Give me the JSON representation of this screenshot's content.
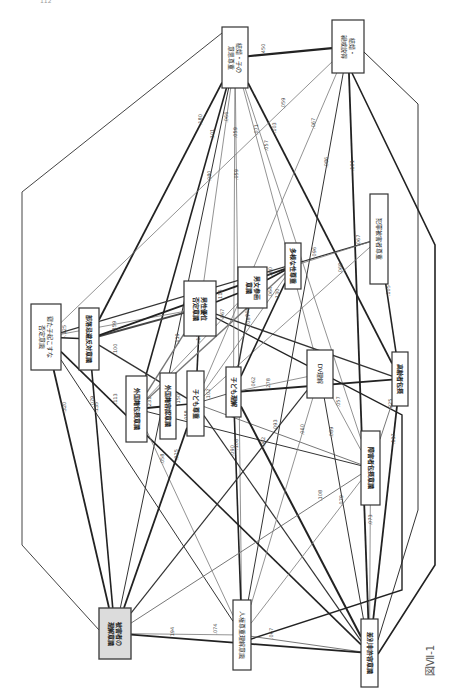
{
  "page_number": "112",
  "figure_label": "図Ⅶ-1",
  "nodes": [
    {
      "id": "kekkon_ko",
      "lines": [
        "結婚・子の",
        "意思尊重"
      ],
      "x": 222,
      "y": 27,
      "w": 26,
      "h": 61,
      "bold": false,
      "shaded": false
    },
    {
      "id": "kekkon_ikou",
      "lines": [
        "結婚・",
        "親戚説得"
      ],
      "x": 332,
      "y": 20,
      "w": 32,
      "h": 53,
      "bold": false,
      "shaded": false
    },
    {
      "id": "neta_ko",
      "lines": [
        "寝た子起こすな",
        "否定意識"
      ],
      "x": 31,
      "y": 304,
      "w": 30,
      "h": 66,
      "bold": false,
      "shaded": false
    },
    {
      "id": "buraku_ishiki",
      "lines": [
        "部落忌避反対意識"
      ],
      "x": 79,
      "y": 308,
      "w": 20,
      "h": 62,
      "bold": true,
      "shaded": false
    },
    {
      "id": "dansei_yui",
      "lines": [
        "男性優位",
        "否定意識"
      ],
      "x": 184,
      "y": 281,
      "w": 32,
      "h": 55,
      "bold": true,
      "shaded": false
    },
    {
      "id": "danjo_sanka",
      "lines": [
        "男女参画",
        "意識"
      ],
      "x": 238,
      "y": 267,
      "w": 29,
      "h": 41,
      "bold": true,
      "shaded": false
    },
    {
      "id": "tayousei",
      "lines": [
        "多様な性尊重"
      ],
      "x": 285,
      "y": 243,
      "w": 16,
      "h": 46,
      "bold": true,
      "shaded": false
    },
    {
      "id": "hanzai",
      "lines": [
        "犯罪被害者尊重"
      ],
      "x": 370,
      "y": 194,
      "w": 18,
      "h": 90,
      "bold": false,
      "shaded": false
    },
    {
      "id": "gaikoku_housetsu",
      "lines": [
        "外国籍包摂意識"
      ],
      "x": 126,
      "y": 376,
      "w": 21,
      "h": 66,
      "bold": true,
      "shaded": false
    },
    {
      "id": "gaikoku_youninn",
      "lines": [
        "外国籍容認意識"
      ],
      "x": 160,
      "y": 373,
      "w": 16,
      "h": 66,
      "bold": true,
      "shaded": false
    },
    {
      "id": "kodomo_sonchou",
      "lines": [
        "子ども尊重"
      ],
      "x": 187,
      "y": 371,
      "w": 17,
      "h": 65,
      "bold": true,
      "shaded": false
    },
    {
      "id": "kodomo_rikai",
      "lines": [
        "子ども理解"
      ],
      "x": 226,
      "y": 367,
      "w": 15,
      "h": 50,
      "bold": true,
      "shaded": false
    },
    {
      "id": "dv_rikai",
      "lines": [
        "DV理解"
      ],
      "x": 307,
      "y": 350,
      "w": 26,
      "h": 48,
      "bold": false,
      "shaded": false
    },
    {
      "id": "koureisha",
      "lines": [
        "高齢者包摂"
      ],
      "x": 392,
      "y": 352,
      "w": 16,
      "h": 54,
      "bold": true,
      "shaded": false
    },
    {
      "id": "shougaisha",
      "lines": [
        "障害者包摂意識"
      ],
      "x": 361,
      "y": 431,
      "w": 19,
      "h": 74,
      "bold": true,
      "shaded": false
    },
    {
      "id": "jinken",
      "lines": [
        "人権尊重理解意識"
      ],
      "x": 233,
      "y": 600,
      "w": 18,
      "h": 70,
      "bold": false,
      "shaded": false
    },
    {
      "id": "higaisha",
      "lines": [
        "被害者の",
        "理解意識"
      ],
      "x": 99,
      "y": 608,
      "w": 32,
      "h": 51,
      "bold": true,
      "shaded": true
    },
    {
      "id": "sabetsu_hinin",
      "lines": [
        "差別非許容意識"
      ],
      "x": 361,
      "y": 619,
      "w": 17,
      "h": 68,
      "bold": true,
      "shaded": false
    }
  ],
  "edges": [
    {
      "from": "kekkon_ko",
      "to": "higaisha",
      "label": ".080",
      "weight": 1.0,
      "color": "#333"
    },
    {
      "from": "kekkon_ko",
      "to": "buraku_ishiki",
      "label": ".180",
      "weight": 1.8,
      "color": "#222"
    },
    {
      "from": "kekkon_ko",
      "to": "gaikoku_housetsu",
      "label": ".101",
      "weight": 1.6,
      "color": "#222"
    },
    {
      "from": "kekkon_ko",
      "to": "dansei_yui",
      "label": ".066",
      "weight": 0.8,
      "color": "#777"
    },
    {
      "from": "kekkon_ko",
      "to": "kekkon_ikou",
      "label": ".450",
      "weight": 2.2,
      "color": "#222"
    },
    {
      "from": "kekkon_ko",
      "to": "koureisha",
      "label": ".103",
      "weight": 1.8,
      "color": "#222"
    },
    {
      "from": "kekkon_ko",
      "to": "shougaisha",
      "label": ".057",
      "weight": 0.8,
      "color": "#777"
    },
    {
      "from": "kekkon_ko",
      "to": "dv_rikai",
      "label": ".071",
      "weight": 0.8,
      "color": "#777"
    },
    {
      "from": "kekkon_ko",
      "to": "kodomo_rikai",
      "label": ".059",
      "weight": 0.8,
      "color": "#777"
    },
    {
      "from": "kekkon_ko",
      "to": "jinken",
      "label": ".059",
      "weight": 0.8,
      "color": "#777"
    },
    {
      "from": "kekkon_ikou",
      "to": "neta_ko",
      "label": ".059",
      "weight": 0.8,
      "color": "#777"
    },
    {
      "from": "kekkon_ikou",
      "to": "kodomo_sonchou",
      "label": ".067",
      "weight": 0.8,
      "color": "#777"
    },
    {
      "from": "kekkon_ikou",
      "to": "sabetsu_hinin",
      "label": ".101",
      "weight": 1.8,
      "color": "#222"
    },
    {
      "from": "kekkon_ikou",
      "to": "jinken",
      "label": ".086",
      "weight": 1.0,
      "color": "#333"
    },
    {
      "from": "hanzai",
      "to": "neta_ko",
      "label": ".096",
      "weight": 1.2,
      "color": "#333"
    },
    {
      "from": "hanzai",
      "to": "tayousei",
      "label": ".067",
      "weight": 0.8,
      "color": "#777"
    },
    {
      "from": "hanzai",
      "to": "kodomo_sonchou",
      "label": ".068",
      "weight": 0.8,
      "color": "#777"
    },
    {
      "from": "hanzai",
      "to": "koureisha",
      "label": ".105",
      "weight": 1.6,
      "color": "#222"
    },
    {
      "from": "neta_ko",
      "to": "buraku_ishiki",
      "label": "-.125",
      "weight": 1.6,
      "color": "#222"
    },
    {
      "from": "neta_ko",
      "to": "higaisha",
      "label": ".320",
      "weight": 1.8,
      "color": "#222"
    },
    {
      "from": "neta_ko",
      "to": "sabetsu_hinin",
      "label": ".113",
      "weight": 1.6,
      "color": "#222"
    },
    {
      "from": "neta_ko",
      "to": "jinken",
      "label": ".079",
      "weight": 1.0,
      "color": "#333"
    },
    {
      "from": "neta_ko",
      "to": "dansei_yui",
      "label": ".071",
      "weight": 0.8,
      "color": "#777"
    },
    {
      "from": "buraku_ishiki",
      "to": "higaisha",
      "label": ".135",
      "weight": 1.6,
      "color": "#222"
    },
    {
      "from": "buraku_ishiki",
      "to": "dansei_yui",
      "label": ".159",
      "weight": 2.0,
      "color": "#444"
    },
    {
      "from": "buraku_ishiki",
      "to": "kodomo_sonchou",
      "label": ".100",
      "weight": 1.4,
      "color": "#333"
    },
    {
      "from": "dansei_yui",
      "to": "danjo_sanka",
      "label": ".115",
      "weight": 1.6,
      "color": "#222"
    },
    {
      "from": "dansei_yui",
      "to": "gaikoku_housetsu",
      "label": ".119",
      "weight": 1.4,
      "color": "#777"
    },
    {
      "from": "dansei_yui",
      "to": "kodomo_sonchou",
      "label": ".132",
      "weight": 1.6,
      "color": "#222"
    },
    {
      "from": "dansei_yui",
      "to": "koureisha",
      "label": ".087",
      "weight": 1.4,
      "color": "#333"
    },
    {
      "from": "danjo_sanka",
      "to": "tayousei",
      "label": ".180",
      "weight": 1.8,
      "color": "#222"
    },
    {
      "from": "danjo_sanka",
      "to": "gaikoku_housetsu",
      "label": ".067",
      "weight": 0.8,
      "color": "#777"
    },
    {
      "from": "danjo_sanka",
      "to": "kodomo_rikai",
      "label": ".068",
      "weight": 1.4,
      "color": "#333"
    },
    {
      "from": "tayousei",
      "to": "buraku_ishiki",
      "label": ".172",
      "weight": 1.8,
      "color": "#222"
    },
    {
      "from": "tayousei",
      "to": "gaikoku_housetsu",
      "label": ".112",
      "weight": 1.4,
      "color": "#777"
    },
    {
      "from": "tayousei",
      "to": "kodomo_rikai",
      "label": ".130",
      "weight": 1.6,
      "color": "#222"
    },
    {
      "from": "tayousei",
      "to": "kodomo_sonchou",
      "label": ".064",
      "weight": 0.8,
      "color": "#777"
    },
    {
      "from": "gaikoku_housetsu",
      "to": "gaikoku_youninn",
      "label": ".231",
      "weight": 1.8,
      "color": "#222"
    },
    {
      "from": "gaikoku_housetsu",
      "to": "shougaisha",
      "label": ".058",
      "weight": 1.0,
      "color": "#333"
    },
    {
      "from": "gaikoku_housetsu",
      "to": "jinken",
      "label": ".058",
      "weight": 0.8,
      "color": "#777"
    },
    {
      "from": "gaikoku_youninn",
      "to": "kodomo_sonchou",
      "label": ".150",
      "weight": 1.6,
      "color": "#222"
    },
    {
      "from": "kodomo_sonchou",
      "to": "kodomo_rikai",
      "label": ".102",
      "weight": 1.0,
      "color": "#555"
    },
    {
      "from": "kodomo_sonchou",
      "to": "higaisha",
      "label": ".325",
      "weight": 1.8,
      "color": "#222"
    },
    {
      "from": "kodomo_sonchou",
      "to": "sabetsu_hinin",
      "label": ".090",
      "weight": 1.2,
      "color": "#333"
    },
    {
      "from": "kodomo_sonchou",
      "to": "shougaisha",
      "label": ".058",
      "weight": 1.0,
      "color": "#777"
    },
    {
      "from": "kodomo_rikai",
      "to": "koureisha",
      "label": ".278",
      "weight": 2.0,
      "color": "#222"
    },
    {
      "from": "kodomo_rikai",
      "to": "sabetsu_hinin",
      "label": ".062",
      "weight": 2.0,
      "color": "#222"
    },
    {
      "from": "kodomo_rikai",
      "to": "dv_rikai",
      "label": ".062",
      "weight": 0.8,
      "color": "#777"
    },
    {
      "from": "kodomo_rikai",
      "to": "jinken",
      "label": ".108",
      "weight": 1.6,
      "color": "#222"
    },
    {
      "from": "dv_rikai",
      "to": "higaisha",
      "label": ".093",
      "weight": 1.2,
      "color": "#333"
    },
    {
      "from": "dv_rikai",
      "to": "jinken",
      "label": ".060",
      "weight": 0.8,
      "color": "#777"
    },
    {
      "from": "dv_rikai",
      "to": "sabetsu_hinin",
      "label": ".089",
      "weight": 1.0,
      "color": "#333"
    },
    {
      "from": "dv_rikai",
      "to": "shougaisha",
      "label": ".057",
      "weight": 0.8,
      "color": "#777"
    },
    {
      "from": "koureisha",
      "to": "shougaisha",
      "label": ".225",
      "weight": 1.0,
      "color": "#777"
    },
    {
      "from": "koureisha",
      "to": "sabetsu_hinin",
      "label": ".117",
      "weight": 1.8,
      "color": "#222"
    },
    {
      "from": "shougaisha",
      "to": "jinken",
      "label": ".079",
      "weight": 0.8,
      "color": "#777"
    },
    {
      "from": "shougaisha",
      "to": "higaisha",
      "label": ".108",
      "weight": 1.0,
      "color": "#777"
    },
    {
      "from": "shougaisha",
      "to": "sabetsu_hinin",
      "label": ".073",
      "weight": 0.8,
      "color": "#777"
    },
    {
      "from": "jinken",
      "to": "sabetsu_hinin",
      "label": ".067",
      "weight": 0.8,
      "color": "#555"
    },
    {
      "from": "jinken",
      "to": "higaisha",
      "label": ".074",
      "weight": 0.8,
      "color": "#777"
    },
    {
      "from": "higaisha",
      "to": "sabetsu_hinin",
      "label": ".194",
      "weight": 1.8,
      "color": "#222"
    }
  ],
  "outer_paths": [
    {
      "id": "outer-left",
      "points": "222,33 22,192 22,545 99,630",
      "weight": 1.0,
      "color": "#444"
    },
    {
      "id": "outer-right-1",
      "points": "364,52 418,104 418,510 378,640",
      "weight": 1.0,
      "color": "#333"
    },
    {
      "id": "outer-right-2",
      "points": "352,73 435,245 435,565 378,654",
      "weight": 1.6,
      "color": "#222"
    },
    {
      "id": "outer-right-3",
      "points": "201,310 402,415 402,590 248,640",
      "weight": 1.4,
      "color": "#222"
    }
  ]
}
